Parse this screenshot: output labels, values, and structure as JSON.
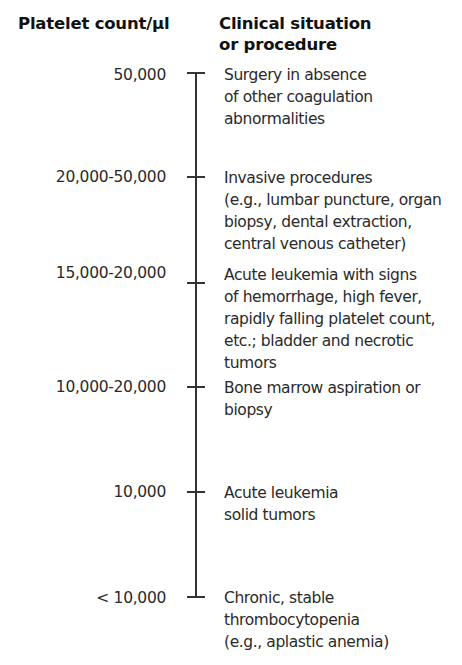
{
  "headers": {
    "left": "Platelet count/µl",
    "right_line1": "Clinical situation",
    "right_line2": "or procedure"
  },
  "rows": [
    {
      "count": "50,000",
      "tick": "top-cap",
      "tick_y": 72,
      "label_y": 65,
      "desc_y": 64,
      "lines": [
        "Surgery in absence",
        "of other coagulation",
        "abnormalities"
      ]
    },
    {
      "count": "20,000-50,000",
      "tick": "cross",
      "tick_y": 176,
      "label_y": 167,
      "desc_y": 167,
      "lines": [
        "Invasive procedures",
        "(e.g., lumbar puncture, organ",
        "biopsy, dental extraction,",
        "central venous catheter)"
      ]
    },
    {
      "count": "15,000-20,000",
      "tick": "cross",
      "tick_y": 282,
      "label_y": 263,
      "desc_y": 264,
      "lines": [
        "Acute leukemia with signs",
        "of hemorrhage, high fever,",
        "rapidly falling platelet count,",
        "etc.; bladder and necrotic",
        "tumors"
      ]
    },
    {
      "count": "10,000-20,000",
      "tick": "cross",
      "tick_y": 386,
      "label_y": 377,
      "desc_y": 377,
      "lines": [
        "Bone marrow aspiration or",
        "biopsy"
      ]
    },
    {
      "count": "10,000",
      "tick": "cross",
      "tick_y": 491,
      "label_y": 482,
      "desc_y": 482,
      "lines": [
        "Acute leukemia",
        "solid tumors"
      ]
    },
    {
      "count": "< 10,000",
      "tick": "bottom-cap",
      "tick_y": 596,
      "label_y": 588,
      "desc_y": 587,
      "lines": [
        "Chronic, stable",
        "thrombocytopenia",
        "(e.g., aplastic anemia)"
      ]
    }
  ],
  "axis": {
    "top": 72,
    "bottom": 597,
    "color": "#333333"
  }
}
